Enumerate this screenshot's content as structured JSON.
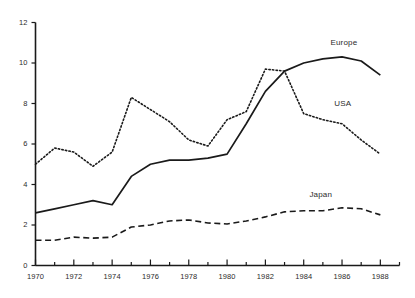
{
  "chart_data": {
    "type": "line",
    "title": "",
    "subtitle": "",
    "xlabel": "",
    "ylabel": "",
    "xlim": [
      1970,
      1989
    ],
    "ylim": [
      0,
      12
    ],
    "grid": false,
    "legend_position": "inline-right-of-series",
    "x": [
      1970,
      1971,
      1972,
      1973,
      1974,
      1975,
      1976,
      1977,
      1978,
      1979,
      1980,
      1981,
      1982,
      1983,
      1984,
      1985,
      1986,
      1987,
      1988
    ],
    "x_tick_labels": [
      "1970",
      "1972",
      "1974",
      "1976",
      "1978",
      "1980",
      "1982",
      "1984",
      "1986",
      "1988"
    ],
    "x_tick_values": [
      1970,
      1972,
      1974,
      1976,
      1978,
      1980,
      1982,
      1984,
      1986,
      1988
    ],
    "x_minor_tick_step": 1,
    "y_tick_labels": [
      "0",
      "2",
      "4",
      "6",
      "8",
      "10",
      "12"
    ],
    "y_tick_values": [
      0,
      2,
      4,
      6,
      8,
      10,
      12
    ],
    "series": [
      {
        "name": "Europe",
        "style": "solid",
        "color": "#1a1a1a",
        "label_point": {
          "x": 1985.4,
          "y": 11.0
        },
        "values": [
          2.6,
          2.8,
          3.0,
          3.2,
          3.0,
          4.4,
          5.0,
          5.2,
          5.2,
          5.3,
          5.5,
          7.0,
          8.6,
          9.6,
          10.0,
          10.2,
          10.3,
          10.1,
          9.4
        ]
      },
      {
        "name": "USA",
        "style": "dotted",
        "color": "#1a1a1a",
        "label_point": {
          "x": 1985.6,
          "y": 8.0
        },
        "values": [
          5.0,
          5.8,
          5.6,
          4.9,
          5.6,
          8.3,
          7.7,
          7.1,
          6.2,
          5.9,
          7.2,
          7.6,
          9.7,
          9.6,
          7.5,
          7.2,
          7.0,
          6.2,
          5.5
        ]
      },
      {
        "name": "Japan",
        "style": "dashed",
        "color": "#1a1a1a",
        "label_point": {
          "x": 1984.3,
          "y": 3.5
        },
        "values": [
          1.25,
          1.25,
          1.4,
          1.35,
          1.4,
          1.9,
          2.0,
          2.2,
          2.25,
          2.1,
          2.05,
          2.2,
          2.4,
          2.65,
          2.7,
          2.7,
          2.85,
          2.8,
          2.5
        ]
      }
    ]
  }
}
